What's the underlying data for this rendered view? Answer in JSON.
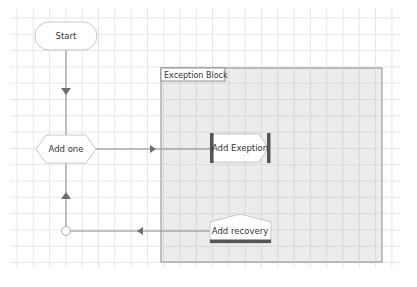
{
  "diagram": {
    "nodes": {
      "start": {
        "label": "Start",
        "shape": "terminator"
      },
      "add_one": {
        "label": "Add one",
        "shape": "hexagon"
      },
      "add_exception": {
        "label": "Add Exeption",
        "shape": "throw-exception"
      },
      "add_recovery": {
        "label": "Add recovery",
        "shape": "recovery"
      },
      "merge": {
        "label": "",
        "shape": "circle-connector"
      }
    },
    "container": {
      "label": "Exception Block"
    },
    "edges": [
      {
        "from": "start",
        "to": "add_one"
      },
      {
        "from": "add_one",
        "to": "add_exception"
      },
      {
        "from": "add_recovery",
        "to": "merge"
      },
      {
        "from": "merge",
        "to": "add_one"
      }
    ],
    "colors": {
      "grid": "#e6e6e6",
      "container_fill": "#ececec",
      "container_border": "#888888",
      "node_fill": "#ffffff",
      "node_border": "#c8c8c8",
      "edge": "#8a8a8a",
      "arrow": "#6e6e6e",
      "accent_bar": "#555555"
    }
  }
}
